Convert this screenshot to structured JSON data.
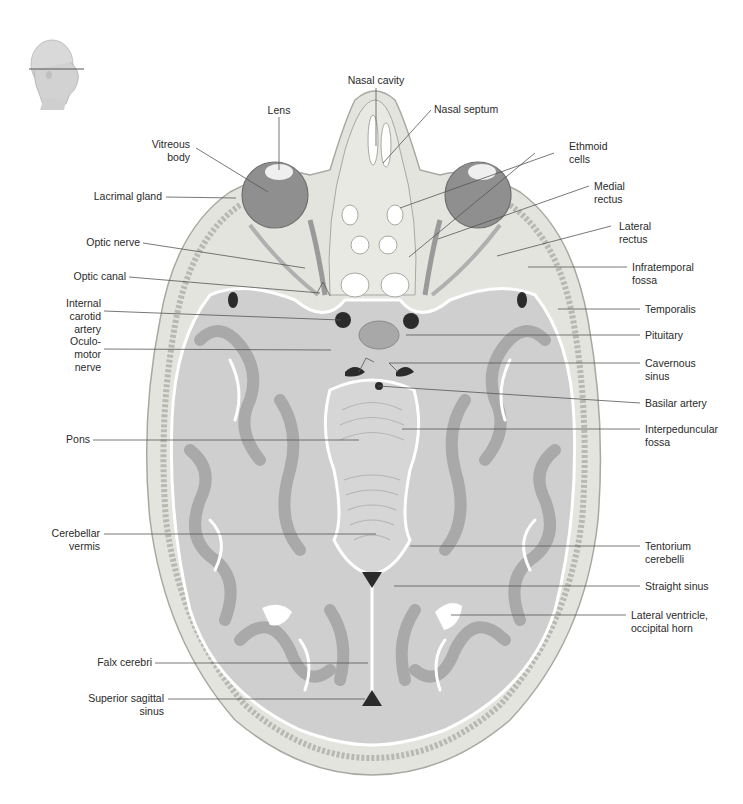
{
  "figure": {
    "view": "Axial (transverse) section of the head at the level of the orbits and pons",
    "orientation_icon": "head-profile-icon",
    "colors": {
      "background": "#ffffff",
      "gray_matter": "#a9a9a9",
      "white_matter": "#cfcfcf",
      "csf_spaces": "#ffffff",
      "bone_scalp": "#dcdcd6",
      "sinus_dark": "#2b2b2b",
      "eyeball": "#8f8f8f",
      "leader_line": "#555555",
      "label_text": "#2a2a2a"
    }
  },
  "labels": {
    "top": [
      {
        "id": "nasal-cavity",
        "text": "Nasal cavity"
      },
      {
        "id": "nasal-septum",
        "text": "Nasal septum"
      },
      {
        "id": "lens",
        "text": "Lens"
      },
      {
        "id": "vitreous-body",
        "text": "Vitreous\nbody"
      }
    ],
    "left": [
      {
        "id": "lacrimal-gland",
        "text": "Lacrimal gland"
      },
      {
        "id": "optic-nerve",
        "text": "Optic nerve"
      },
      {
        "id": "optic-canal",
        "text": "Optic canal"
      },
      {
        "id": "internal-carotid-artery",
        "text": "Internal\ncarotid\nartery"
      },
      {
        "id": "oculomotor-nerve",
        "text": "Oculo-\nmotor\nnerve"
      },
      {
        "id": "pons",
        "text": "Pons"
      },
      {
        "id": "cerebellar-vermis",
        "text": "Cerebellar\nvermis"
      },
      {
        "id": "falx-cerebri",
        "text": "Falx cerebri"
      },
      {
        "id": "superior-sagittal-sinus",
        "text": "Superior sagittal\nsinus"
      }
    ],
    "right": [
      {
        "id": "ethmoid-cells",
        "text": "Ethmoid\ncells"
      },
      {
        "id": "medial-rectus",
        "text": "Medial\nrectus"
      },
      {
        "id": "lateral-rectus",
        "text": "Lateral\nrectus"
      },
      {
        "id": "infratemporal-fossa",
        "text": "Infratemporal\nfossa"
      },
      {
        "id": "temporalis",
        "text": "Temporalis"
      },
      {
        "id": "pituitary",
        "text": "Pituitary"
      },
      {
        "id": "cavernous-sinus",
        "text": "Cavernous\nsinus"
      },
      {
        "id": "basilar-artery",
        "text": "Basilar artery"
      },
      {
        "id": "interpeduncular-fossa",
        "text": "Interpeduncular\nfossa"
      },
      {
        "id": "tentorium-cerebelli",
        "text": "Tentorium\ncerebelli"
      },
      {
        "id": "straight-sinus",
        "text": "Straight sinus"
      },
      {
        "id": "lateral-ventricle-occipital-horn",
        "text": "Lateral ventricle,\noccipital horn"
      }
    ]
  }
}
